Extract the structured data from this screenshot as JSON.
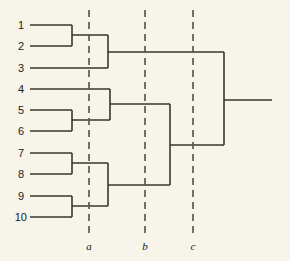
{
  "figure": {
    "type": "dendrogram",
    "background_color": "#f7f4e9",
    "line_color": "#3a3629",
    "cut_line_color": "#5d5948",
    "width": 290,
    "height": 261
  },
  "leaves": [
    {
      "label": "1",
      "y": 25,
      "x_start": 30
    },
    {
      "label": "2",
      "y": 46,
      "x_start": 30
    },
    {
      "label": "3",
      "y": 68,
      "x_start": 30
    },
    {
      "label": "4",
      "y": 89,
      "x_start": 30
    },
    {
      "label": "5",
      "y": 110,
      "x_start": 30
    },
    {
      "label": "6",
      "y": 131,
      "x_start": 30
    },
    {
      "label": "7",
      "y": 153,
      "x_start": 30
    },
    {
      "label": "8",
      "y": 174,
      "x_start": 30
    },
    {
      "label": "9",
      "y": 196,
      "x_start": 30
    },
    {
      "label": "10",
      "y": 217,
      "x_start": 30
    }
  ],
  "label_x": {
    "single_digit": 24,
    "double_digit": 27
  },
  "merges": [
    {
      "name": "merge-1-2",
      "x": 72,
      "y_top": 25,
      "y_bottom": 46
    },
    {
      "name": "merge-12-3",
      "x": 108,
      "y_top": 35,
      "y_bottom": 68
    },
    {
      "name": "merge-5-6",
      "x": 72,
      "y_top": 110,
      "y_bottom": 131
    },
    {
      "name": "merge-4-56",
      "x": 110,
      "y_top": 89,
      "y_bottom": 120
    },
    {
      "name": "merge-7-8",
      "x": 72,
      "y_top": 153,
      "y_bottom": 174
    },
    {
      "name": "merge-9-10",
      "x": 72,
      "y_top": 196,
      "y_bottom": 217
    },
    {
      "name": "merge-78-910",
      "x": 108,
      "y_top": 163,
      "y_bottom": 206
    },
    {
      "name": "merge-456-78910",
      "x": 170,
      "y_top": 104,
      "y_bottom": 185
    },
    {
      "name": "merge-root",
      "x": 224,
      "y_top": 52,
      "y_bottom": 145
    }
  ],
  "connectors": [
    {
      "name": "connector-12-to-123",
      "y": 35,
      "x_from": 72,
      "x_to": 108
    },
    {
      "name": "connector-123-to-root",
      "y": 52,
      "x_from": 108,
      "x_to": 224
    },
    {
      "name": "connector-56-to-456",
      "y": 120,
      "x_from": 72,
      "x_to": 110
    },
    {
      "name": "connector-456-to-join",
      "y": 104,
      "x_from": 110,
      "x_to": 170
    },
    {
      "name": "connector-78-to-78910",
      "y": 163,
      "x_from": 72,
      "x_to": 108
    },
    {
      "name": "connector-910-to-78910",
      "y": 206,
      "x_from": 72,
      "x_to": 108
    },
    {
      "name": "connector-78910-to-join",
      "y": 185,
      "x_from": 108,
      "x_to": 170
    },
    {
      "name": "connector-join-to-root",
      "y": 145,
      "x_from": 170,
      "x_to": 224
    },
    {
      "name": "connector-root-stem",
      "y": 100,
      "x_from": 224,
      "x_to": 272
    }
  ],
  "cut_lines": [
    {
      "label": "a",
      "x": 89,
      "y_top": 10,
      "y_bottom": 238,
      "label_y": 250
    },
    {
      "label": "b",
      "x": 145,
      "y_top": 10,
      "y_bottom": 238,
      "label_y": 250
    },
    {
      "label": "c",
      "x": 193,
      "y_top": 10,
      "y_bottom": 238,
      "label_y": 250
    }
  ]
}
